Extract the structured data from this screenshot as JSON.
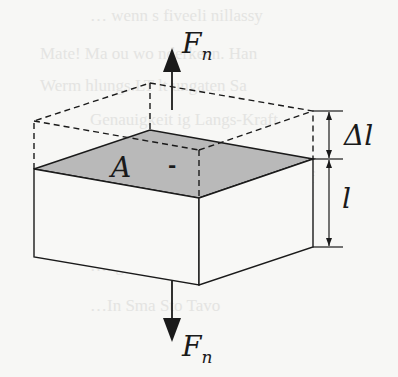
{
  "diagram": {
    "labels": {
      "force_top": "F",
      "force_top_sub": "n",
      "force_bottom": "F",
      "force_bottom_sub": "n",
      "area": "A",
      "area_mark": "-",
      "elongation": "Δl",
      "length": "l"
    },
    "colors": {
      "stroke": "#1a1a1a",
      "top_face_fill": "#b9b9b9",
      "background": "#f7f7f5"
    },
    "background_text": [
      "… wenn s fiveeli nillassy",
      "Mate! Ma ou wo nderkeen. Han",
      "Werm hlungs.LT lt ungaten Sa",
      "Genauigkeit ig Langs-Kraft",
      "…c i ne beiden g das de tu sef",
      "…ts de der Datei Osiscleon Sa",
      "…ngs-Kraft om Kraft",
      "…In Sma Sto Tavo"
    ]
  }
}
